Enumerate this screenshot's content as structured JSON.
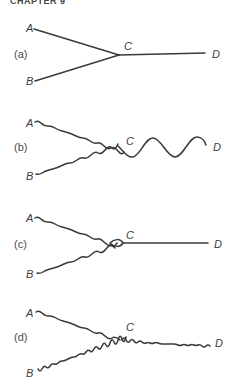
{
  "header": {
    "text": "CHAPTER 9"
  },
  "panels": [
    {
      "id": "a",
      "label": "(a)",
      "nodes": {
        "A": "A",
        "B": "B",
        "C": "C",
        "D": "D"
      },
      "description": "Straight lines A-C and B-C merge into straight line C-D"
    },
    {
      "id": "b",
      "label": "(b)",
      "nodes": {
        "A": "A",
        "B": "B",
        "C": "C",
        "D": "D"
      },
      "description": "Small-wavelength wavy lines A-C and B-C merge into a long-wavelength wave C-D"
    },
    {
      "id": "c",
      "label": "(c)",
      "nodes": {
        "A": "A",
        "B": "B",
        "C": "C",
        "D": "D"
      },
      "description": "Wavy lines A-C and B-C form a loop at C, then straight line C-D"
    },
    {
      "id": "d",
      "label": "(d)",
      "nodes": {
        "A": "A",
        "B": "B",
        "C": "C",
        "D": "D"
      },
      "description": "Wavy line A-C and tight-wavy line B-C merge into tight-wavy line C-D"
    }
  ],
  "colors": {
    "line": "#3a3a3a",
    "text": "#3c3c3c",
    "background": "#ffffff"
  }
}
